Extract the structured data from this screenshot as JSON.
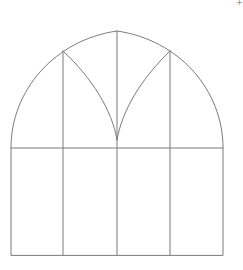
{
  "diagram": {
    "stroke_color": "#7a7a7a",
    "stroke_width": 1,
    "outline": {
      "left_x": 11,
      "right_x": 223,
      "bottom_y": 255,
      "spring_y": 148,
      "apex": [
        117,
        31
      ]
    },
    "transom_y": 148,
    "mullions_x": [
      63,
      117,
      170
    ],
    "tracery": {
      "left_shoulder": [
        63,
        51
      ],
      "right_shoulder": [
        170,
        51
      ],
      "cusp": [
        117,
        140
      ]
    },
    "panes": {
      "rows": 2,
      "columns": 4
    }
  },
  "corner_mark": {
    "glyph": "+",
    "color": "#8a8a8a"
  }
}
